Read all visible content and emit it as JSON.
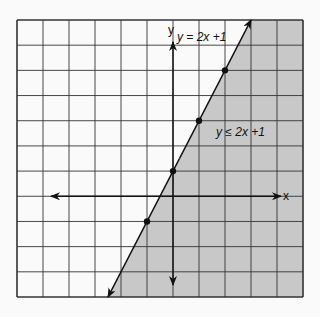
{
  "chart_data": {
    "type": "line",
    "title": "",
    "xlabel": "x",
    "ylabel": "y",
    "xlim": [
      -6,
      5
    ],
    "ylim": [
      -4,
      7
    ],
    "grid": true,
    "series": [
      {
        "name": "y = 2x + 1",
        "equation": "y = 2x + 1",
        "points": [
          [
            -1,
            -1
          ],
          [
            0,
            1
          ],
          [
            1,
            3
          ],
          [
            2,
            5
          ]
        ],
        "line_extent": [
          [
            -2.5,
            -4
          ],
          [
            3,
            7
          ]
        ]
      }
    ],
    "shaded_region": {
      "inequality": "y ≤ 2x + 1",
      "side": "right/below line",
      "color": "#c8c8c8"
    },
    "annotations": [
      {
        "text": "y = 2x +1",
        "at": [
          1.2,
          5.5
        ]
      },
      {
        "text": "y ≤ 2x +1",
        "at": [
          1.6,
          2.0
        ]
      }
    ]
  },
  "labels": {
    "x_axis": "x",
    "y_axis": "y",
    "line_label": "y = 2x +1",
    "region_label": "y ≤ 2x +1"
  },
  "colors": {
    "shade": "#c8c8c8",
    "grid": "#333333",
    "axes": "#111111",
    "background": "#fafafa"
  }
}
